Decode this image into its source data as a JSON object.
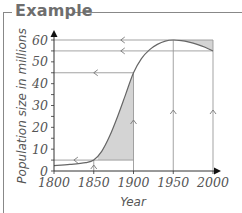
{
  "header": {
    "title": "Example"
  },
  "chart_data": {
    "type": "line",
    "title": "Example",
    "xlabel": "Year",
    "ylabel": "Population size in millions",
    "xlim": [
      1800,
      2000
    ],
    "ylim": [
      0,
      60
    ],
    "x_ticks": [
      1800,
      1850,
      1900,
      1950,
      2000
    ],
    "y_ticks": [
      0,
      10,
      20,
      30,
      40,
      50,
      60
    ],
    "y_minor_tick_step": 5,
    "grid": false,
    "series": [
      {
        "name": "Population",
        "x": [
          1800,
          1820,
          1840,
          1850,
          1860,
          1870,
          1880,
          1890,
          1900,
          1910,
          1920,
          1930,
          1940,
          1950,
          1960,
          1970,
          1980,
          1990,
          2000
        ],
        "values": [
          2.5,
          3.0,
          3.8,
          5.0,
          9.0,
          16.0,
          25.0,
          35.0,
          45.0,
          51.5,
          55.5,
          58.0,
          59.5,
          60.0,
          59.7,
          59.0,
          58.0,
          56.7,
          55.0
        ]
      }
    ],
    "reference_lines": {
      "horizontal": [
        {
          "y": 60,
          "x_from": 1800,
          "x_to": 2000,
          "arrow": "left"
        },
        {
          "y": 55,
          "x_from": 1800,
          "x_to": 2000,
          "arrow": "left"
        },
        {
          "y": 45,
          "x_from": 1800,
          "x_to": 1900,
          "arrow": "left"
        },
        {
          "y": 5,
          "x_from": 1800,
          "x_to": 1900,
          "arrow": "left"
        }
      ],
      "vertical": [
        {
          "x": 1850,
          "y_from": 0,
          "y_to": 5,
          "arrow": "up"
        },
        {
          "x": 1900,
          "y_from": 0,
          "y_to": 45,
          "arrow": "up"
        },
        {
          "x": 1950,
          "y_from": 0,
          "y_to": 60,
          "arrow": "up"
        },
        {
          "x": 2000,
          "y_from": 0,
          "y_to": 60,
          "arrow": "up"
        }
      ]
    },
    "shaded_regions": [
      {
        "description": "area between curve and y=5 line from ~1855 to 1900",
        "x_from": 1855,
        "x_to": 1900,
        "y_base": 5
      },
      {
        "description": "area between y=60 line and curve from 1950 to 2000",
        "x_from": 1950,
        "x_to": 2000,
        "y_top": 60
      }
    ],
    "colors": {
      "axis": "#222222",
      "curve": "#666666",
      "reference": "#999999",
      "shade": "#d4d4d4",
      "text": "#555555"
    }
  }
}
